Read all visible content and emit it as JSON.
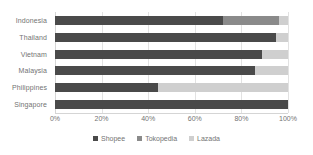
{
  "chart_data": {
    "type": "bar",
    "orientation": "horizontal",
    "stacked": true,
    "stack_mode": "percent",
    "title": "",
    "xlabel": "",
    "ylabel": "",
    "xlim": [
      0,
      100
    ],
    "grid": true,
    "legend_position": "bottom",
    "categories": [
      "Indonesia",
      "Thailand",
      "Vietnam",
      "Malaysia",
      "Philippines",
      "Singapore"
    ],
    "tick_labels": [
      "0%",
      "20%",
      "40%",
      "60%",
      "80%",
      "100%"
    ],
    "tick_values": [
      0,
      20,
      40,
      60,
      80,
      100
    ],
    "series": [
      {
        "name": "Shopee",
        "color": "#4a4a4a",
        "values": [
          72,
          95,
          89,
          86,
          44,
          100
        ]
      },
      {
        "name": "Tokopedia",
        "color": "#8a8a8a",
        "values": [
          24,
          0,
          0,
          0,
          0,
          0
        ]
      },
      {
        "name": "Lazada",
        "color": "#cfcfcf",
        "values": [
          4,
          5,
          11,
          14,
          56,
          0
        ]
      }
    ]
  }
}
